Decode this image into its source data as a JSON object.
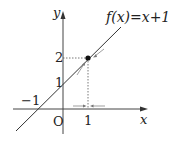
{
  "diagram": {
    "function_label": "f(x)=x+1",
    "axis_x_label": "x",
    "axis_y_label": "y",
    "origin_label": "O",
    "tick_x_1": "1",
    "tick_x_neg1": "−1",
    "tick_y_1": "1",
    "tick_y_2": "2",
    "point": {
      "x": 1,
      "y": 2
    },
    "colors": {
      "line": "#333333",
      "guide": "#555555"
    }
  }
}
